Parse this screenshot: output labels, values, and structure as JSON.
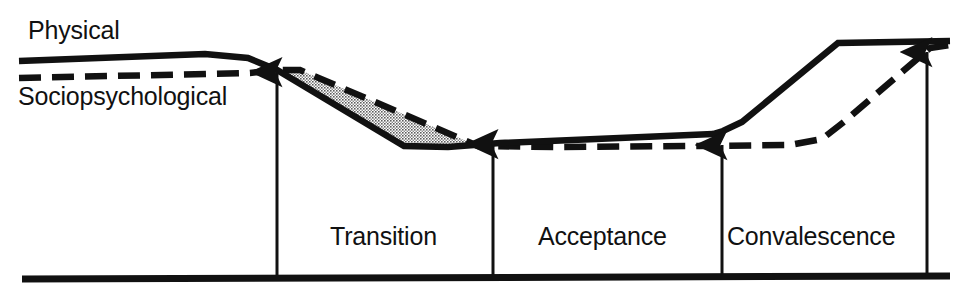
{
  "figure": {
    "background_color": "#ffffff",
    "ink_color": "#111111",
    "shaded_region_color": "#b9b9b9"
  },
  "curve_labels": {
    "physical": "Physical",
    "sociopsychological": "Sociopsychological"
  },
  "phase_labels": [
    {
      "name": "transition",
      "label": "Transition"
    },
    {
      "name": "acceptance",
      "label": "Acceptance"
    },
    {
      "name": "convalescence",
      "label": "Convalescence"
    }
  ],
  "chart_data": {
    "type": "line",
    "title": "",
    "xlabel": "",
    "ylabel": "",
    "xlim": [
      0,
      961
    ],
    "ylim": [
      293,
      0
    ],
    "grid": false,
    "legend": "inline-curve-labels",
    "axis": {
      "baseline_y": 278,
      "baseline_x_start": 22,
      "baseline_x_end": 950,
      "note": "single thick horizontal baseline, no tick marks or numeric scale"
    },
    "series": [
      {
        "name": "Physical",
        "style": "solid",
        "stroke_width": 6,
        "points": [
          [
            19,
            61
          ],
          [
            205,
            54
          ],
          [
            248,
            58
          ],
          [
            277,
            70
          ],
          [
            404,
            146
          ],
          [
            448,
            147
          ],
          [
            500,
            143
          ],
          [
            713,
            134
          ],
          [
            723,
            131
          ],
          [
            742,
            122
          ],
          [
            838,
            43
          ],
          [
            950,
            41
          ]
        ]
      },
      {
        "name": "Sociopsychological",
        "style": "dashed",
        "stroke_width": 6,
        "dash_pattern": "22 11",
        "points": [
          [
            19,
            78
          ],
          [
            250,
            73
          ],
          [
            277,
            70
          ],
          [
            300,
            70
          ],
          [
            478,
            146
          ],
          [
            560,
            147
          ],
          [
            700,
            146
          ],
          [
            790,
            145
          ],
          [
            822,
            139
          ],
          [
            845,
            121
          ],
          [
            930,
            48
          ],
          [
            950,
            45
          ]
        ]
      }
    ],
    "shaded_region": {
      "name": "gap-between-physical-and-sociopsychological",
      "fill": "halftone-dot-pattern",
      "description": "Stippled area between the earlier-declining Physical curve and the later-declining Sociopsychological curve during Transition",
      "polygon": [
        [
          282,
          70
        ],
        [
          300,
          70
        ],
        [
          478,
          146
        ],
        [
          404,
          146
        ],
        [
          277,
          70
        ]
      ]
    },
    "annotations": [
      {
        "name": "arrow-transition-start",
        "x": 277,
        "y_from": 278,
        "y_to": 70,
        "direction": "up",
        "marks": "onset of Transition"
      },
      {
        "name": "arrow-acceptance-start",
        "x": 493,
        "y_from": 278,
        "y_to": 142,
        "direction": "up",
        "marks": "onset of Acceptance"
      },
      {
        "name": "arrow-convalescence-start",
        "x": 722,
        "y_from": 278,
        "y_to": 143,
        "direction": "up",
        "marks": "onset of Convalescence"
      },
      {
        "name": "arrow-recovery-end",
        "x": 927,
        "y_from": 278,
        "y_to": 50,
        "direction": "up",
        "marks": "completion of recovery"
      }
    ]
  }
}
